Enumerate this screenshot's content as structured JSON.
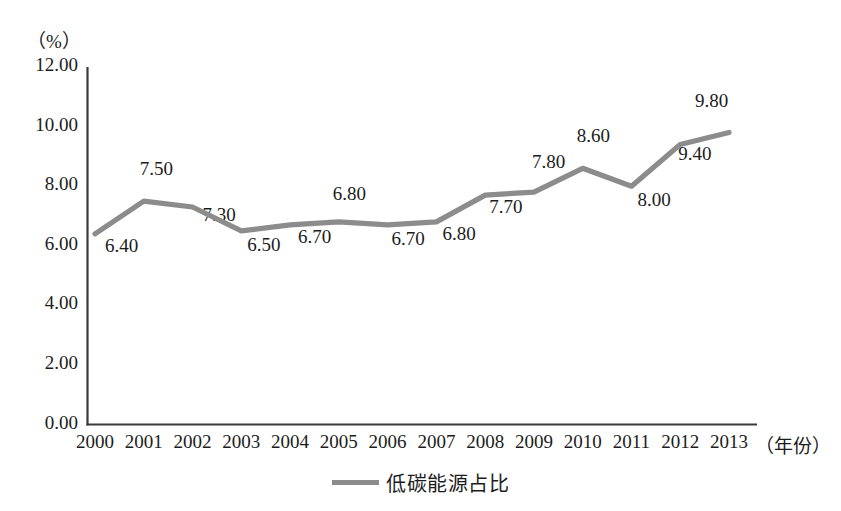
{
  "chart_data": {
    "type": "line",
    "title": "",
    "subtitle": "",
    "xlabel": "（年份）",
    "ylabel": "（%）",
    "categories": [
      "2000",
      "2001",
      "2002",
      "2003",
      "2004",
      "2005",
      "2006",
      "2007",
      "2008",
      "2009",
      "2010",
      "2011",
      "2012",
      "2013"
    ],
    "series": [
      {
        "name": "低碳能源占比",
        "values": [
          6.4,
          7.5,
          7.3,
          6.5,
          6.7,
          6.8,
          6.7,
          6.8,
          7.7,
          7.8,
          8.6,
          8.0,
          9.4,
          9.8
        ],
        "color": "#8c8c8c"
      }
    ],
    "point_labels": [
      "6.40",
      "7.50",
      "7.30",
      "6.50",
      "6.70",
      "6.80",
      "6.70",
      "6.80",
      "7.70",
      "7.80",
      "8.60",
      "8.00",
      "9.40",
      "9.80"
    ],
    "ylim": [
      0,
      12
    ],
    "yticks": [
      0,
      2,
      4,
      6,
      8,
      10,
      12
    ],
    "ytick_labels": [
      "0.00",
      "2.00",
      "4.00",
      "6.00",
      "8.00",
      "10.00",
      "12.00"
    ],
    "grid": false,
    "legend_position": "bottom-center"
  },
  "axis": {
    "y_unit": "（%）",
    "x_unit": "（年份）",
    "line_color": "#3a3a3a"
  },
  "legend": {
    "swatch_name": "line-swatch",
    "label": "低碳能源占比"
  }
}
